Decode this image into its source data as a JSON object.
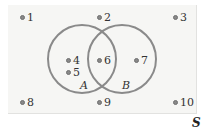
{
  "diagram": {
    "type": "venn",
    "universe_label": "S",
    "sets": [
      {
        "name": "A",
        "elements": [
          "4",
          "5",
          "6"
        ]
      },
      {
        "name": "B",
        "elements": [
          "6",
          "7"
        ]
      }
    ],
    "intersection": [
      "6"
    ],
    "outside": [
      "1",
      "2",
      "3",
      "8",
      "9",
      "10"
    ],
    "elements": [
      {
        "label": "1"
      },
      {
        "label": "2"
      },
      {
        "label": "3"
      },
      {
        "label": "4"
      },
      {
        "label": "5"
      },
      {
        "label": "6"
      },
      {
        "label": "7"
      },
      {
        "label": "8"
      },
      {
        "label": "9"
      },
      {
        "label": "10"
      }
    ],
    "colors": {
      "circle_stroke": "#8a8a8a",
      "background": "#f6f6f4",
      "dot": "#888888"
    }
  }
}
